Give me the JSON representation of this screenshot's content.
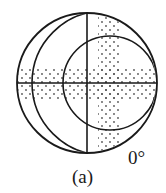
{
  "figure": {
    "caption": "(a)",
    "angle_label": "0°",
    "colors": {
      "line": "#1a1a1a",
      "dots": "#555555",
      "background": "#ffffff"
    },
    "geometry": {
      "outer_circle": {
        "cx": 87,
        "cy": 83,
        "r": 70
      },
      "middle_arc_circle": {
        "cx": 104,
        "cy": 83,
        "r": 72
      },
      "inner_arc_circle": {
        "cx": 110,
        "cy": 83,
        "r": 47
      },
      "horizontal_band": {
        "y1": 67,
        "y2": 100
      },
      "vertical_band": {
        "x1": 98,
        "x2": 121
      },
      "dot_spacing": 4
    }
  }
}
